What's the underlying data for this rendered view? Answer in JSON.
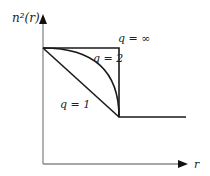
{
  "diagram": {
    "y_axis_label": "n²(r)",
    "x_axis_label": "r",
    "curves": [
      {
        "label": "q = ∞",
        "shape": "step"
      },
      {
        "label": "q = 2",
        "shape": "parabolic"
      },
      {
        "label": "q = 1",
        "shape": "linear"
      }
    ],
    "colors": {
      "axis": "#777777",
      "curve": "#1a1a1a"
    }
  }
}
